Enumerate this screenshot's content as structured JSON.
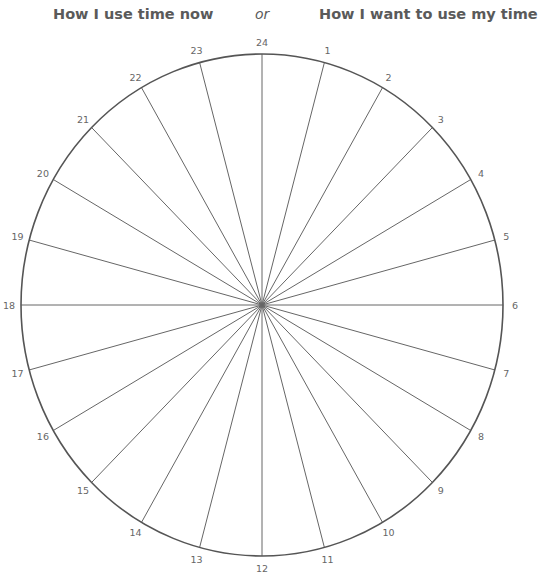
{
  "titles": {
    "left": "How I use time now",
    "separator": "or",
    "right": "How I want to use my time"
  },
  "wheel": {
    "segments": 24,
    "hours": [
      "1",
      "2",
      "3",
      "4",
      "5",
      "6",
      "7",
      "8",
      "9",
      "10",
      "11",
      "12",
      "13",
      "14",
      "15",
      "16",
      "17",
      "18",
      "19",
      "20",
      "21",
      "22",
      "23",
      "24"
    ],
    "center": [
      262,
      305
    ],
    "radius_x": 241,
    "radius_y": 251,
    "rim_color": "#555555",
    "spoke_color": "#666666",
    "label_color": "#666666"
  }
}
